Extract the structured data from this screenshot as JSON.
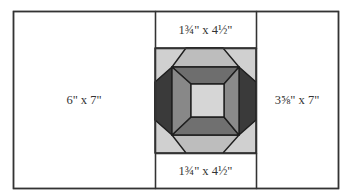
{
  "diagram": {
    "type": "quilt-block-layout",
    "outline_color": "#333333",
    "background": "#ffffff",
    "outer_rect": {
      "x": 13,
      "y": 11,
      "w": 325,
      "h": 177
    },
    "panels": [
      {
        "id": "left",
        "label": "6\" x 7\"",
        "x": 13,
        "y": 11,
        "w": 142,
        "h": 177
      },
      {
        "id": "top-middle",
        "label": "1¾\" x 4½\"",
        "x": 155,
        "y": 11,
        "w": 101,
        "h": 37
      },
      {
        "id": "center-block",
        "label": "",
        "x": 155,
        "y": 48,
        "w": 101,
        "h": 105
      },
      {
        "id": "bottom-middle",
        "label": "1¾\" x 4½\"",
        "x": 155,
        "y": 153,
        "w": 101,
        "h": 35
      },
      {
        "id": "right",
        "label": "3⅝\" x 7\"",
        "x": 256,
        "y": 11,
        "w": 82,
        "h": 177
      }
    ],
    "labels": {
      "left": "6\" x 7\"",
      "top_middle": "1¾\" x 4½\"",
      "bottom_middle": "1¾\" x 4½\"",
      "right": "3⅝\" x 7\""
    },
    "block": {
      "colors": {
        "corner_light": "#d0d0d0",
        "octagon_top_bottom": "#bdbdbd",
        "side_dark": "#3a3a3a",
        "frame_top": "#6e6e6e",
        "frame_bottom": "#707070",
        "frame_left": "#888888",
        "frame_right": "#8a8a8a",
        "center_square": "#d6d6d6"
      },
      "shapes": [
        {
          "name": "block-background",
          "fill": "corner_light",
          "points": "155,48 256,48 256,153 155,153"
        },
        {
          "name": "octagon-top",
          "fill": "octagon_top_bottom",
          "points": "186,48 223,48 239,67 172,67"
        },
        {
          "name": "octagon-bottom",
          "fill": "octagon_top_bottom",
          "points": "172,135 239,135 223,153 186,153"
        },
        {
          "name": "side-left-dark",
          "fill": "side_dark",
          "points": "172,67 172,135 155,120 155,82"
        },
        {
          "name": "side-right-dark",
          "fill": "side_dark",
          "points": "239,67 256,82 256,120 239,135"
        },
        {
          "name": "frame-top",
          "fill": "frame_top",
          "points": "172,67 239,67 224,84 191,84"
        },
        {
          "name": "frame-bottom",
          "fill": "frame_bottom",
          "points": "191,117 224,117 239,135 172,135"
        },
        {
          "name": "frame-left",
          "fill": "frame_left",
          "points": "172,67 191,84 191,117 172,135"
        },
        {
          "name": "frame-right",
          "fill": "frame_right",
          "points": "239,67 239,135 224,117 224,84"
        },
        {
          "name": "center-square",
          "fill": "center_square",
          "points": "191,84 224,84 224,117 191,117"
        }
      ]
    }
  }
}
